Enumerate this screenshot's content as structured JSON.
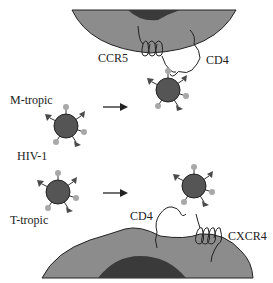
{
  "diagram": {
    "labels": {
      "ccr5": "CCR5",
      "cd4_top": "CD4",
      "m_tropic": "M-tropic",
      "hiv1": "HIV-1",
      "t_tropic": "T-tropic",
      "cd4_bottom": "CD4",
      "cxcr4": "CXCR4"
    },
    "colors": {
      "cell": "#8c8c8c",
      "nucleus": "#3a3a3a",
      "virion": "#555555",
      "spike_knob": "#a8a8a8",
      "spike_flag": "#4a4a4a",
      "outline": "#222222"
    }
  }
}
